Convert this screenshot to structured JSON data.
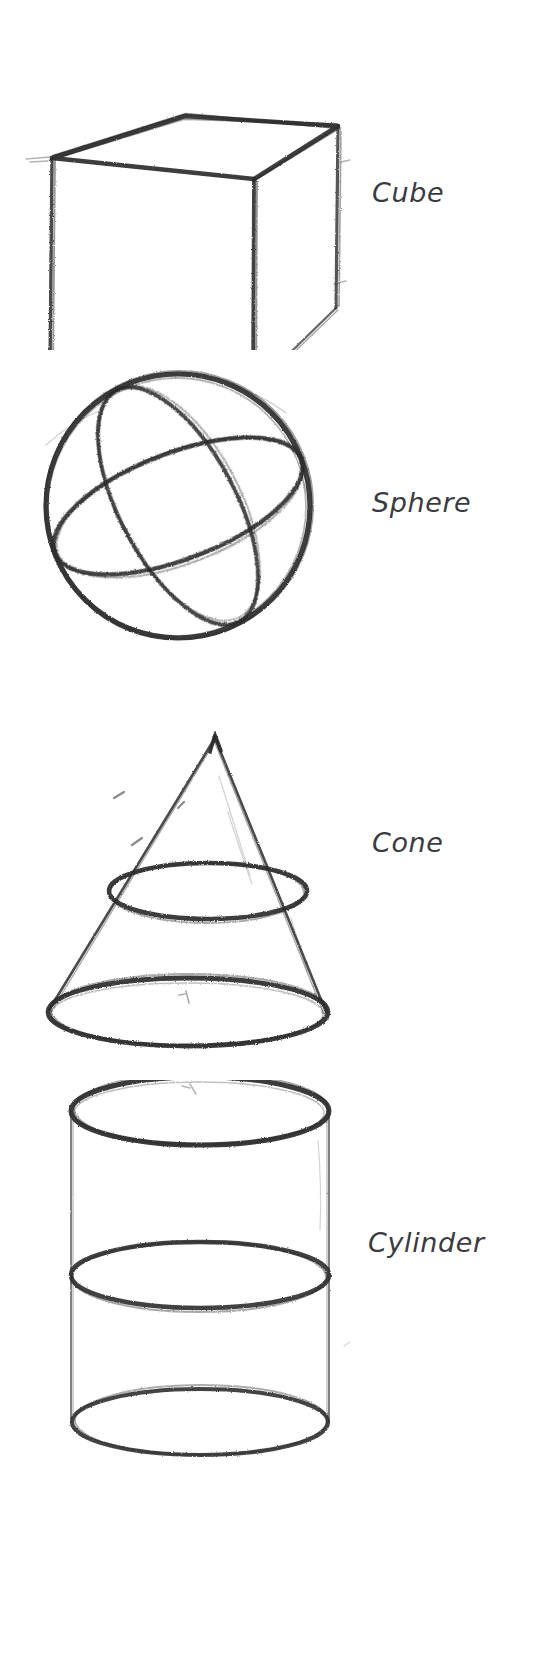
{
  "page": {
    "background_color": "#ffffff",
    "ink_color": "#2b2b2b",
    "label_color": "#3b3b3f",
    "width": 534,
    "height": 1674
  },
  "figures": [
    {
      "id": "cube",
      "label": "Cube",
      "shape": "cube",
      "description": "Three-quarter view wireframe cube in perspective with visible top face and two side faces"
    },
    {
      "id": "sphere",
      "label": "Sphere",
      "shape": "sphere",
      "description": "Circle with two crossing construction ellipses showing the horizontal and tilted great circles"
    },
    {
      "id": "cone",
      "label": "Cone",
      "shape": "cone",
      "description": "Cone with apex at top, an inner cross-section ellipse and a wide base ellipse"
    },
    {
      "id": "cylinder",
      "label": "Cylinder",
      "shape": "cylinder",
      "description": "Upright cylinder with top ellipse, a middle construction ellipse and a bottom ellipse"
    }
  ],
  "labels": {
    "cube": "Cube",
    "sphere": "Sphere",
    "cone": "Cone",
    "cylinder": "Cylinder"
  }
}
